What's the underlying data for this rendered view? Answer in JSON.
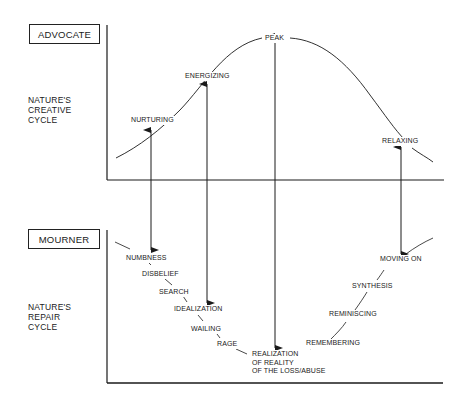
{
  "top_panel": {
    "role": "ADVOCATE",
    "cycle_label": [
      "NATURE'S",
      "CREATIVE",
      "CYCLE"
    ],
    "stages": [
      "NURTURING",
      "ENERGIZING",
      "PEAK",
      "RELAXING"
    ]
  },
  "bottom_panel": {
    "role": "MOURNER",
    "cycle_label": [
      "NATURE'S",
      "REPAIR",
      "CYCLE"
    ],
    "stages": [
      "NUMBNESS",
      "DISBELIEF",
      "SEARCH",
      "IDEALIZATION",
      "WAILING",
      "RAGE",
      "REALIZATION",
      "OF REALITY",
      "OF THE LOSS/ABUSE",
      "REMEMBERING",
      "REMINISCING",
      "SYNTHESIS",
      "MOVING ON"
    ]
  },
  "connections": [
    {
      "from": "NUMBNESS",
      "to": "NURTURING"
    },
    {
      "from": "IDEALIZATION",
      "to": "ENERGIZING"
    },
    {
      "from": "REALIZATION OF REALITY OF THE LOSS/ABUSE",
      "to": "PEAK"
    },
    {
      "from": "MOVING ON",
      "to": "RELAXING"
    }
  ],
  "colors": {
    "ink": "#1a1a1a",
    "paper": "#ffffff"
  }
}
